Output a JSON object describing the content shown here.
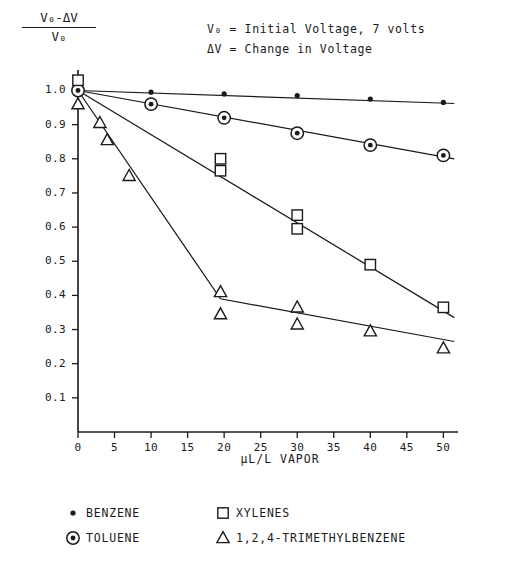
{
  "chart_data": {
    "type": "scatter",
    "title": "",
    "xlabel": "μL/L VAPOR",
    "ylabel_numerator": "V₀-ΔV",
    "ylabel_denominator": "V₀",
    "xlim": [
      0,
      52
    ],
    "ylim": [
      0,
      1.06
    ],
    "xticks": [
      0,
      5,
      10,
      15,
      20,
      25,
      30,
      35,
      40,
      45,
      50
    ],
    "yticks": [
      0.1,
      0.2,
      0.3,
      0.4,
      0.5,
      0.6,
      0.7,
      0.8,
      0.9,
      1.0
    ],
    "xtick_labels": [
      "0",
      "5",
      "10",
      "15",
      "20",
      "25",
      "30",
      "35",
      "40",
      "45",
      "50"
    ],
    "ytick_labels": [
      "0.1",
      "0.2",
      "0.3",
      "0.4",
      "0.5",
      "0.6",
      "0.7",
      "0.8",
      "0.9",
      "1.0"
    ],
    "grid": false,
    "legend_position": "below-axes",
    "annotations": [
      "V₀ = Initial Voltage, 7 volts",
      "ΔV = Change in Voltage"
    ],
    "series": [
      {
        "name": "BENZENE",
        "marker": "dot",
        "points": [
          {
            "x": 0,
            "y": 1.0
          },
          {
            "x": 10,
            "y": 0.995
          },
          {
            "x": 20,
            "y": 0.99
          },
          {
            "x": 30,
            "y": 0.985
          },
          {
            "x": 40,
            "y": 0.975
          },
          {
            "x": 50,
            "y": 0.965
          }
        ],
        "fit_line": [
          {
            "x": 0,
            "y": 1.0
          },
          {
            "x": 51.5,
            "y": 0.962
          }
        ]
      },
      {
        "name": "TOLUENE",
        "marker": "circled-dot",
        "points": [
          {
            "x": 0,
            "y": 1.0
          },
          {
            "x": 10,
            "y": 0.96
          },
          {
            "x": 20,
            "y": 0.92
          },
          {
            "x": 30,
            "y": 0.875
          },
          {
            "x": 40,
            "y": 0.84
          },
          {
            "x": 50,
            "y": 0.81
          }
        ],
        "fit_line": [
          {
            "x": 0,
            "y": 1.0
          },
          {
            "x": 51.5,
            "y": 0.8
          }
        ]
      },
      {
        "name": "XYLENES",
        "marker": "square",
        "points": [
          {
            "x": 0,
            "y": 1.03
          },
          {
            "x": 19.5,
            "y": 0.8
          },
          {
            "x": 19.5,
            "y": 0.765
          },
          {
            "x": 30,
            "y": 0.635
          },
          {
            "x": 30,
            "y": 0.595
          },
          {
            "x": 40,
            "y": 0.49
          },
          {
            "x": 50,
            "y": 0.365
          }
        ],
        "fit_line": [
          {
            "x": 0,
            "y": 1.0
          },
          {
            "x": 51.5,
            "y": 0.335
          }
        ]
      },
      {
        "name": "1,2,4-TRIMETHYLBENZENE",
        "marker": "triangle",
        "points": [
          {
            "x": 0,
            "y": 0.96
          },
          {
            "x": 3,
            "y": 0.905
          },
          {
            "x": 4,
            "y": 0.855
          },
          {
            "x": 7,
            "y": 0.75
          },
          {
            "x": 19.5,
            "y": 0.41
          },
          {
            "x": 19.5,
            "y": 0.345
          },
          {
            "x": 30,
            "y": 0.365
          },
          {
            "x": 30,
            "y": 0.315
          },
          {
            "x": 40,
            "y": 0.295
          },
          {
            "x": 50,
            "y": 0.245
          }
        ],
        "fit_line": [
          {
            "x": 0,
            "y": 1.0
          },
          {
            "x": 19.5,
            "y": 0.39
          },
          {
            "x": 51.5,
            "y": 0.265
          }
        ]
      }
    ]
  },
  "legend": {
    "rows": [
      [
        {
          "symbol": "dot",
          "label": "BENZENE"
        },
        {
          "symbol": "square",
          "label": "XYLENES"
        }
      ],
      [
        {
          "symbol": "circled-dot",
          "label": "TOLUENE"
        },
        {
          "symbol": "triangle",
          "label": "1,2,4-TRIMETHYLBENZENE"
        }
      ]
    ]
  },
  "colors": {
    "ink": "#1a1a1a",
    "background": "#ffffff"
  }
}
